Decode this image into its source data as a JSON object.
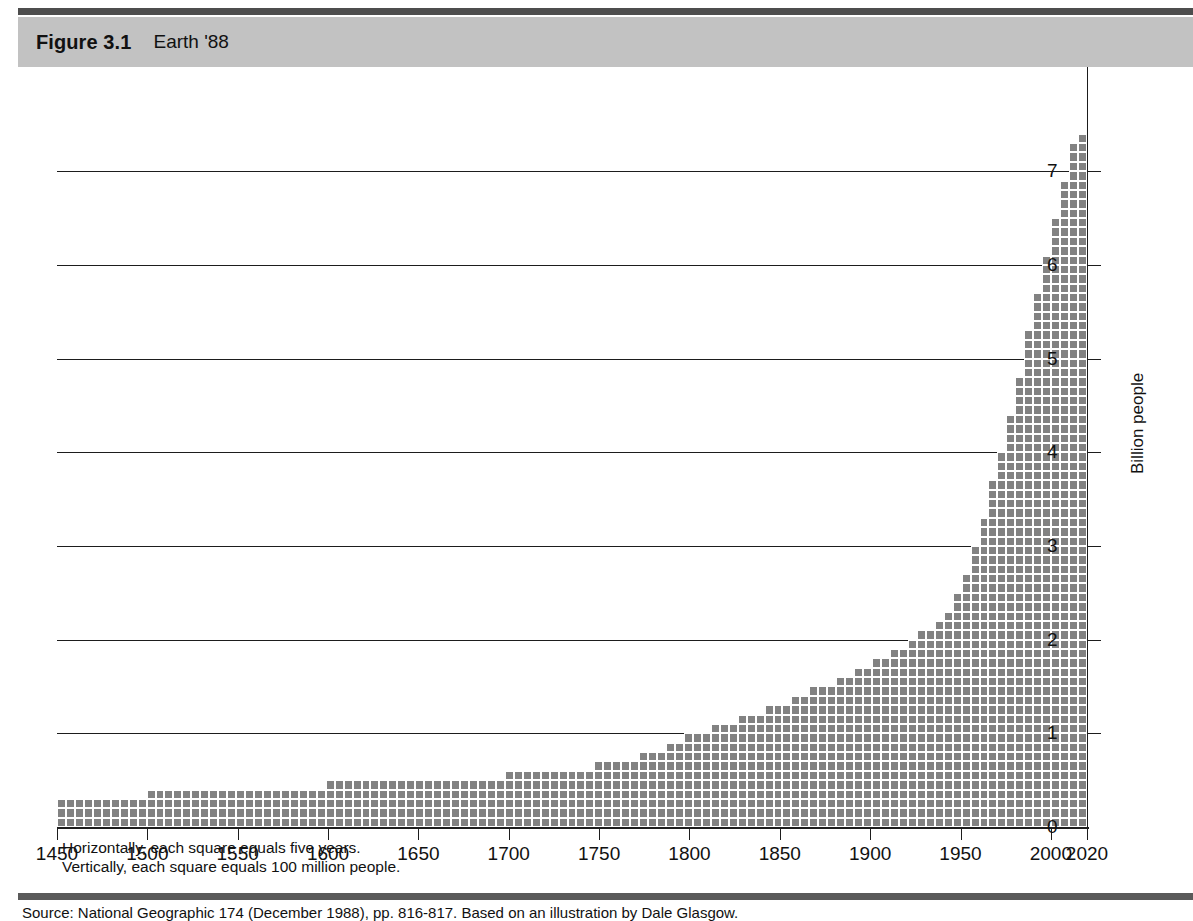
{
  "figure": {
    "number": "Figure 3.1",
    "title": "Earth '88"
  },
  "notes": {
    "line1": "Horizontally, each square equals five years.",
    "line2": "Vertically, each square equals 100 million people."
  },
  "source": "Source: National Geographic 174 (December 1988), pp. 816-817. Based on an illustration by Dale Glasgow.",
  "colors": {
    "square_fill": "#828282",
    "square_gap": "#ffffff",
    "band": "#c2c2c2",
    "rule_top": "#4d4d4d",
    "rule_bottom": "#5a5a5a",
    "axis": "#1d1d1d"
  },
  "chart_data": {
    "type": "area",
    "title": "Earth '88",
    "xlabel": "",
    "ylabel": "Billion people",
    "xlim": [
      1450,
      2020
    ],
    "ylim": [
      0,
      7.6
    ],
    "xticks": [
      1450,
      1500,
      1550,
      1600,
      1650,
      1700,
      1750,
      1800,
      1850,
      1900,
      1950,
      2000,
      2020
    ],
    "xticklabels": [
      "1450",
      "1500",
      "1550",
      "1600",
      "1650",
      "1700",
      "1750",
      "1800",
      "1850",
      "1900",
      "1950",
      "2000",
      "2020"
    ],
    "yticks": [
      0,
      1,
      2,
      3,
      4,
      5,
      6,
      7
    ],
    "yticklabels": [
      "0",
      "1",
      "2",
      "3",
      "4",
      "5",
      "6",
      "7"
    ],
    "grid": true,
    "grid_axis": "y",
    "unit_note": "each square = 5 years horizontally, 100 million people vertically",
    "square_years": 5,
    "square_people_millions": 100,
    "x": [
      1450,
      1455,
      1460,
      1465,
      1470,
      1475,
      1480,
      1485,
      1490,
      1495,
      1500,
      1505,
      1510,
      1515,
      1520,
      1525,
      1530,
      1535,
      1540,
      1545,
      1550,
      1555,
      1560,
      1565,
      1570,
      1575,
      1580,
      1585,
      1590,
      1595,
      1600,
      1605,
      1610,
      1615,
      1620,
      1625,
      1630,
      1635,
      1640,
      1645,
      1650,
      1655,
      1660,
      1665,
      1670,
      1675,
      1680,
      1685,
      1690,
      1695,
      1700,
      1705,
      1710,
      1715,
      1720,
      1725,
      1730,
      1735,
      1740,
      1745,
      1750,
      1755,
      1760,
      1765,
      1770,
      1775,
      1780,
      1785,
      1790,
      1795,
      1800,
      1805,
      1810,
      1815,
      1820,
      1825,
      1830,
      1835,
      1840,
      1845,
      1850,
      1855,
      1860,
      1865,
      1870,
      1875,
      1880,
      1885,
      1890,
      1895,
      1900,
      1905,
      1910,
      1915,
      1920,
      1925,
      1930,
      1935,
      1940,
      1945,
      1950,
      1955,
      1960,
      1965,
      1970,
      1975,
      1980,
      1985,
      1990,
      1995,
      2000,
      2005,
      2010,
      2015,
      2020
    ],
    "y_squares": [
      3,
      3,
      3,
      3,
      3,
      3,
      3,
      3,
      3,
      3,
      4,
      4,
      4,
      4,
      4,
      4,
      4,
      4,
      4,
      4,
      4,
      4,
      4,
      4,
      4,
      4,
      4,
      4,
      4,
      4,
      5,
      5,
      5,
      5,
      5,
      5,
      5,
      5,
      5,
      5,
      5,
      5,
      5,
      5,
      5,
      5,
      5,
      5,
      5,
      5,
      6,
      6,
      6,
      6,
      6,
      6,
      6,
      6,
      6,
      6,
      7,
      7,
      7,
      7,
      7,
      8,
      8,
      8,
      9,
      9,
      10,
      10,
      10,
      11,
      11,
      11,
      12,
      12,
      12,
      13,
      13,
      13,
      14,
      14,
      15,
      15,
      15,
      16,
      16,
      17,
      17,
      18,
      18,
      19,
      19,
      20,
      21,
      21,
      22,
      23,
      25,
      27,
      30,
      33,
      37,
      40,
      44,
      48,
      53,
      57,
      61,
      65,
      69,
      73,
      74
    ],
    "series": [
      {
        "name": "World population",
        "unit": "billion people",
        "values": [
          0.3,
          0.3,
          0.3,
          0.3,
          0.3,
          0.3,
          0.3,
          0.3,
          0.3,
          0.3,
          0.4,
          0.4,
          0.4,
          0.4,
          0.4,
          0.4,
          0.4,
          0.4,
          0.4,
          0.4,
          0.4,
          0.4,
          0.4,
          0.4,
          0.4,
          0.4,
          0.4,
          0.4,
          0.4,
          0.4,
          0.5,
          0.5,
          0.5,
          0.5,
          0.5,
          0.5,
          0.5,
          0.5,
          0.5,
          0.5,
          0.5,
          0.5,
          0.5,
          0.5,
          0.5,
          0.5,
          0.5,
          0.5,
          0.5,
          0.5,
          0.6,
          0.6,
          0.6,
          0.6,
          0.6,
          0.6,
          0.6,
          0.6,
          0.6,
          0.6,
          0.7,
          0.7,
          0.7,
          0.7,
          0.7,
          0.8,
          0.8,
          0.8,
          0.9,
          0.9,
          1.0,
          1.0,
          1.0,
          1.1,
          1.1,
          1.1,
          1.2,
          1.2,
          1.2,
          1.3,
          1.3,
          1.3,
          1.4,
          1.4,
          1.5,
          1.5,
          1.5,
          1.6,
          1.6,
          1.7,
          1.7,
          1.8,
          1.8,
          1.9,
          1.9,
          2.0,
          2.1,
          2.1,
          2.2,
          2.3,
          2.5,
          2.7,
          3.0,
          3.3,
          3.7,
          4.0,
          4.4,
          4.8,
          5.3,
          5.7,
          6.1,
          6.5,
          6.9,
          7.3,
          7.4
        ]
      }
    ]
  }
}
